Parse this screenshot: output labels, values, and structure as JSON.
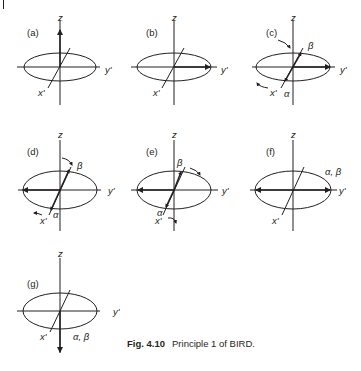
{
  "figure": {
    "caption": {
      "number": "Fig. 4.10",
      "text": "Principle 1 of BIRD."
    },
    "axis_labels": {
      "z": "z",
      "x": "x'",
      "y": "y'"
    },
    "panels": [
      {
        "id": "a",
        "label": "(a)",
        "description": "magnetization along +z",
        "spin_labels": []
      },
      {
        "id": "b",
        "label": "(b)",
        "description": "magnetization along +y'",
        "spin_labels": []
      },
      {
        "id": "c",
        "label": "(c)",
        "description": "alpha and beta components diverge along x' axis",
        "spin_labels": [
          "β",
          "α"
        ]
      },
      {
        "id": "d",
        "label": "(d)",
        "description": "after 180° pulse, vector along -y'",
        "spin_labels": [
          "β",
          "α"
        ]
      },
      {
        "id": "e",
        "label": "(e)",
        "description": "components refocusing",
        "spin_labels": [
          "β",
          "α"
        ]
      },
      {
        "id": "f",
        "label": "(f)",
        "description": "refocused along -y' and +y'",
        "spin_labels": [
          "α, β"
        ]
      },
      {
        "id": "g",
        "label": "(g)",
        "description": "magnetization along -z",
        "spin_labels": [
          "α, β"
        ]
      }
    ]
  }
}
